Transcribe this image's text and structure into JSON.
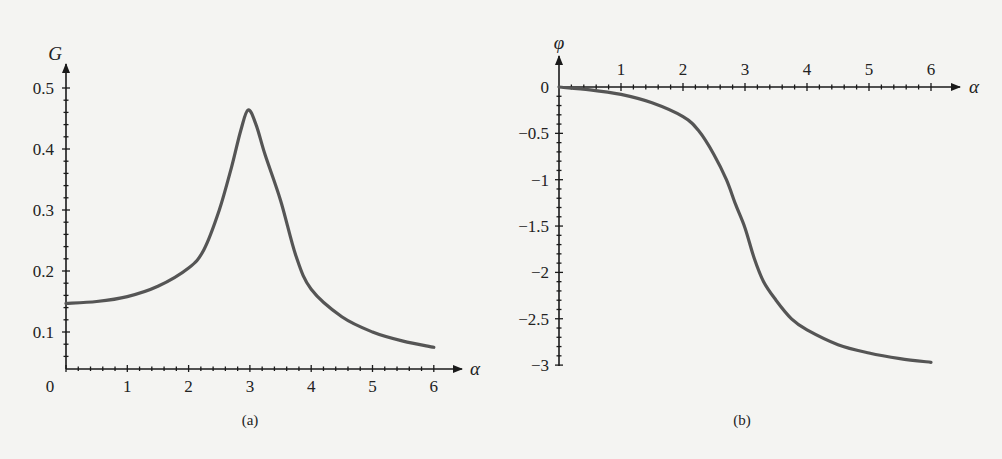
{
  "colors": {
    "background": "#f4f4f2",
    "axis": "#1a1a1a",
    "curve": "#555555"
  },
  "chart_data": [
    {
      "type": "line",
      "panel": "(a)",
      "title": "",
      "xlabel": "α",
      "ylabel": "G",
      "xlim": [
        0,
        6.4
      ],
      "ylim": [
        0.04,
        0.53
      ],
      "x_ticks": [
        0,
        1,
        2,
        3,
        4,
        5,
        6
      ],
      "x_tick_labels": [
        "0",
        "1",
        "2",
        "3",
        "4",
        "5",
        "6"
      ],
      "y_ticks": [
        0.1,
        0.2,
        0.3,
        0.4,
        0.5
      ],
      "y_tick_labels": [
        "0.1",
        "0.2",
        "0.3",
        "0.4",
        "0.5"
      ],
      "grid": false,
      "series": [
        {
          "name": "G(α)",
          "x": [
            0,
            0.5,
            1,
            1.5,
            2,
            2.25,
            2.5,
            2.7,
            2.85,
            2.97,
            3.1,
            3.25,
            3.5,
            3.75,
            4,
            4.5,
            5,
            5.5,
            6
          ],
          "y": [
            0.147,
            0.15,
            0.158,
            0.175,
            0.205,
            0.235,
            0.3,
            0.37,
            0.43,
            0.464,
            0.44,
            0.39,
            0.316,
            0.225,
            0.17,
            0.125,
            0.1,
            0.085,
            0.075
          ]
        }
      ]
    },
    {
      "type": "line",
      "panel": "(b)",
      "title": "",
      "xlabel": "α",
      "ylabel": "φ",
      "xlim": [
        0,
        6.4
      ],
      "ylim": [
        -3.0,
        0.3
      ],
      "x_ticks": [
        1,
        2,
        3,
        4,
        5,
        6
      ],
      "x_tick_labels": [
        "1",
        "2",
        "3",
        "4",
        "5",
        "6"
      ],
      "y_ticks": [
        0,
        -0.5,
        -1,
        -1.5,
        -2,
        -2.5,
        -3
      ],
      "y_tick_labels": [
        "0",
        "−0.5",
        "−1",
        "−1.5",
        "−2",
        "−2.5",
        "−3"
      ],
      "grid": false,
      "series": [
        {
          "name": "φ(α)",
          "x": [
            0,
            0.5,
            1,
            1.5,
            2,
            2.25,
            2.5,
            2.7,
            2.85,
            3.0,
            3.15,
            3.3,
            3.5,
            3.75,
            4,
            4.5,
            5,
            5.5,
            6
          ],
          "y": [
            0,
            -0.03,
            -0.08,
            -0.17,
            -0.32,
            -0.47,
            -0.73,
            -1.0,
            -1.27,
            -1.52,
            -1.85,
            -2.1,
            -2.3,
            -2.5,
            -2.62,
            -2.78,
            -2.87,
            -2.93,
            -2.97
          ]
        }
      ]
    }
  ],
  "captions": {
    "a": "(a)",
    "b": "(b)"
  }
}
